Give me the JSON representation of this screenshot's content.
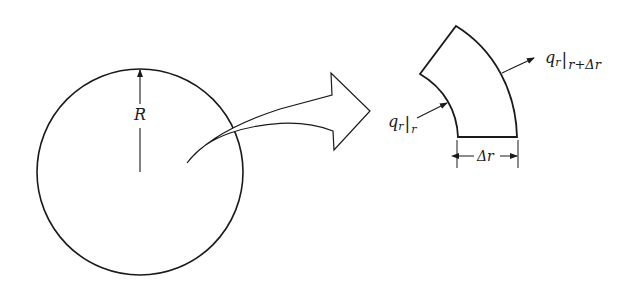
{
  "figure": {
    "circle": {
      "label": "R",
      "description": "circular cross-section of radius R"
    },
    "transition_arrow": {
      "description": "curved block arrow from circle interior to magnified element"
    },
    "element": {
      "description": "annular shell element",
      "flux_in": {
        "symbol": "q",
        "subscript": "r",
        "eval_at": "r"
      },
      "flux_out": {
        "symbol": "q",
        "subscript": "r",
        "eval_at": "r+Δr"
      },
      "thickness_label": "Δr"
    }
  },
  "colors": {
    "stroke": "#1a1a1a",
    "background": "#ffffff"
  }
}
